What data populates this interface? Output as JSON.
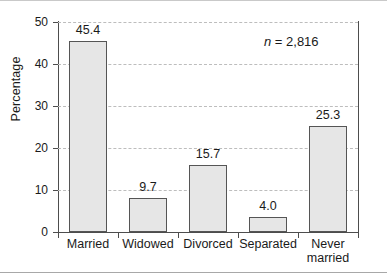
{
  "chart_data": {
    "type": "bar",
    "title": "",
    "subtitle": "",
    "xlabel": "",
    "ylabel": "Percentage",
    "categories": [
      "Married",
      "Widowed",
      "Divorced",
      "Separated",
      "Never married"
    ],
    "category_lines": [
      [
        "Married"
      ],
      [
        "Widowed"
      ],
      [
        "Divorced"
      ],
      [
        "Separated"
      ],
      [
        "Never",
        "married"
      ]
    ],
    "values": [
      45.4,
      9.7,
      15.7,
      4.0,
      25.3
    ],
    "data_labels": [
      "45.4",
      "9.7",
      "15.7",
      "4.0",
      "25.3"
    ],
    "bar_drawn_heights": [
      45.4,
      8.0,
      15.9,
      3.5,
      25.3
    ],
    "ylim": [
      0,
      50
    ],
    "yticks": [
      0,
      10,
      20,
      30,
      40,
      50
    ],
    "ytick_labels": [
      "0",
      "10",
      "20",
      "30",
      "40",
      "50"
    ],
    "grid": "dashed horizontal gridlines at 10, 20, 30, 40, 50",
    "legend": "none",
    "bar_fill_color": "#e6e6e6",
    "bar_border_color": "#555555",
    "gridline_color": "#bdbdbd",
    "axis_color": "#4d4d4d",
    "text_color": "#1a1a1a",
    "annotations": [
      {
        "id": "sample-size",
        "symbol": "n",
        "text": " = 2,816",
        "full": "n = 2,816"
      }
    ]
  }
}
